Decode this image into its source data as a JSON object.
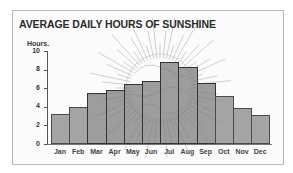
{
  "chart_data": {
    "type": "bar",
    "title": "AVERAGE DAILY HOURS OF SUNSHINE",
    "xlabel": "",
    "ylabel": "Hours.",
    "ylim": [
      0,
      10
    ],
    "yticks": [
      0,
      2,
      4,
      6,
      8,
      10
    ],
    "grid": false,
    "legend": null,
    "categories": [
      "Jan",
      "Feb",
      "Mar",
      "Apr",
      "May",
      "Jun",
      "Jul",
      "Aug",
      "Sep",
      "Oct",
      "Nov",
      "Dec"
    ],
    "values": [
      3.2,
      4.0,
      5.5,
      5.8,
      6.5,
      6.8,
      8.8,
      8.3,
      6.6,
      5.2,
      3.9,
      3.1
    ],
    "background_decoration": "sun-illustration",
    "bar_color": "#8c8c8c"
  },
  "labels": {
    "title": "AVERAGE DAILY HOURS OF SUNSHINE",
    "y_unit": "Hours."
  }
}
